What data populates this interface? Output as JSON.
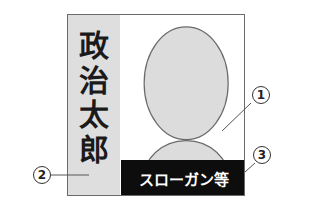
{
  "poster": {
    "candidate_name_chars": [
      "政",
      "治",
      "太",
      "郎"
    ],
    "slogan": "スローガン等",
    "colors": {
      "name_column_bg": "#dedede",
      "portrait_fill": "#dcdcdc",
      "slogan_bg": "#0d0d0d",
      "slogan_text": "#ffffff",
      "border": "#6a6a6a"
    }
  },
  "callouts": [
    {
      "id": "callout-1",
      "label": "①",
      "target": "portrait"
    },
    {
      "id": "callout-2",
      "label": "②",
      "target": "name-column"
    },
    {
      "id": "callout-3",
      "label": "③",
      "target": "slogan-bar"
    }
  ]
}
